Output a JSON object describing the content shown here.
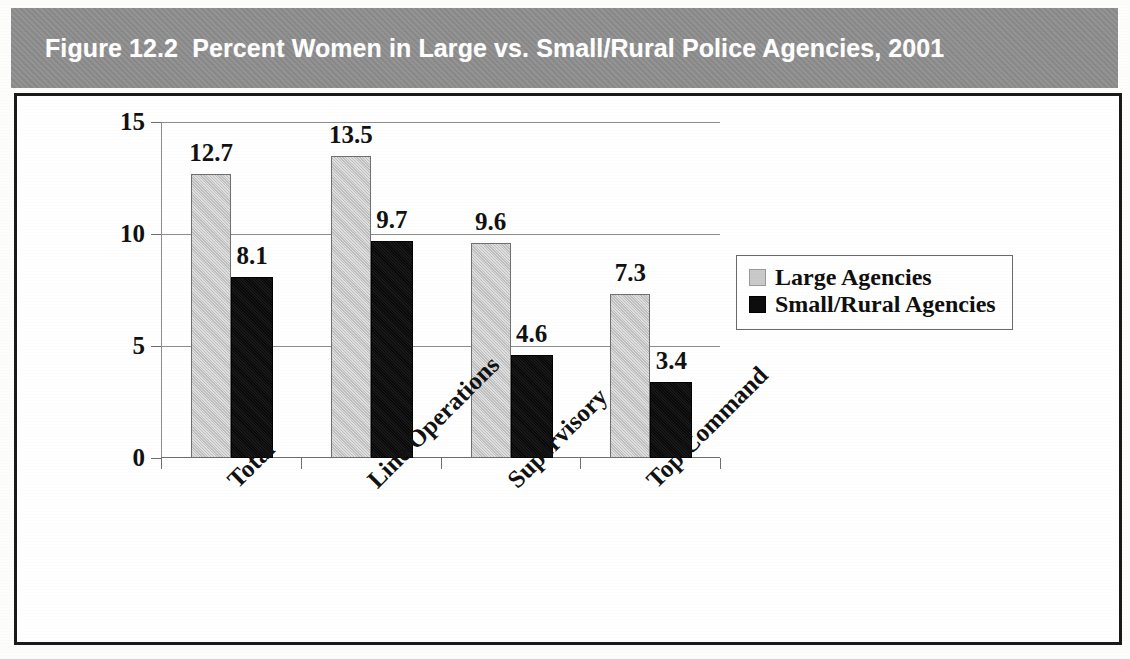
{
  "figure": {
    "title": "Figure 12.2  Percent Women in Large vs. Small/Rural Police Agencies, 2001",
    "title_bar_color": "#8f8f8f",
    "title_text_color": "#ffffff",
    "frame_border_color": "#1a1a1a"
  },
  "chart_data": {
    "type": "bar",
    "title": "Figure 12.2  Percent Women in Large vs. Small/Rural Police Agencies, 2001",
    "xlabel": "",
    "ylabel": "",
    "ylim": [
      0,
      15
    ],
    "yticks": [
      0,
      5,
      10,
      15
    ],
    "ytick_labels": [
      "0",
      "5",
      "10",
      "15"
    ],
    "grid": true,
    "legend_position": "right",
    "categories": [
      "Total",
      "Line Operations",
      "Supervisory",
      "Top Command"
    ],
    "series": [
      {
        "name": "Large Agencies",
        "color": "#c9c9c9",
        "values": [
          12.7,
          13.5,
          9.6,
          7.3
        ],
        "labels": [
          "12.7",
          "13.5",
          "9.6",
          "7.3"
        ]
      },
      {
        "name": "Small/Rural Agencies",
        "color": "#0d0d0d",
        "values": [
          8.1,
          9.7,
          4.6,
          3.4
        ],
        "labels": [
          "8.1",
          "9.7",
          "4.6",
          "3.4"
        ]
      }
    ]
  },
  "legend": {
    "items": [
      {
        "label": "Large Agencies",
        "swatch": "large"
      },
      {
        "label": "Small/Rural Agencies",
        "swatch": "small"
      }
    ]
  }
}
